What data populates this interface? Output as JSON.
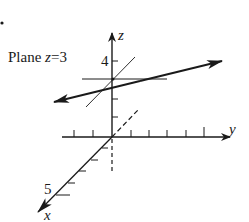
{
  "figure": {
    "plane_label": "Plane z=3",
    "plane_label_prefix": "Plane ",
    "plane_label_var": "z",
    "plane_label_eq": "=3",
    "axes": {
      "x_label": "x",
      "y_label": "y",
      "z_label": "z"
    },
    "tick_labels": {
      "z_tick": "4",
      "x_tick": "5"
    },
    "colors": {
      "ink": "#1a1a1a",
      "background": "#ffffff"
    }
  }
}
